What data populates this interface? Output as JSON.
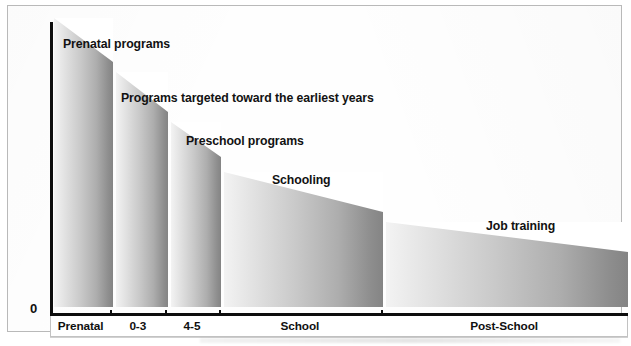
{
  "chart_data": {
    "type": "bar",
    "title": "",
    "subtitle": "",
    "xlabel": "",
    "ylabel": "Rate of Return to Investment in Human Capital",
    "y_zero_tick": "0",
    "grid": false,
    "legend_position": "none",
    "y_axis_note": "unlabeled ordinal scale, only the origin 0 is marked",
    "categories": [
      "Prenatal",
      "0-3",
      "4-5",
      "School",
      "Post-School"
    ],
    "series": [
      {
        "name": "Rate of return to investment in human capital",
        "values": [
          0.98,
          0.8,
          0.63,
          0.46,
          0.29
        ],
        "value_note": "normalized heights read off the bar tops; curve declines monotonically"
      }
    ],
    "bar_top_left_fraction": [
      1.0,
      0.8,
      0.63,
      0.46,
      0.29
    ],
    "bar_top_right_fraction": [
      0.84,
      0.67,
      0.52,
      0.33,
      0.19
    ],
    "annotations": [
      {
        "text": "Prenatal programs",
        "left": 55,
        "top": 31
      },
      {
        "text": "Programs targeted toward the earliest years",
        "left": 113,
        "top": 85
      },
      {
        "text": "Preschool programs",
        "left": 178,
        "top": 128
      },
      {
        "text": "Schooling",
        "left": 264,
        "top": 167
      },
      {
        "text": "Job training",
        "left": 478,
        "top": 213
      }
    ],
    "bars": [
      {
        "label": "Prenatal",
        "left": 46,
        "width": 59,
        "top_left": 18,
        "top_right": 62
      },
      {
        "label": "0-3",
        "left": 108,
        "width": 52,
        "top_left": 72,
        "top_right": 112
      },
      {
        "label": "4-5",
        "left": 163,
        "width": 50,
        "top_left": 122,
        "top_right": 157
      },
      {
        "label": "School",
        "left": 216,
        "width": 159,
        "top_left": 172,
        "top_right": 212
      },
      {
        "label": "Post-School",
        "left": 378,
        "width": 242,
        "top_left": 222,
        "top_right": 252
      }
    ],
    "category_cells": [
      {
        "label": "Prenatal",
        "flex": 59
      },
      {
        "label": "0-3",
        "flex": 55
      },
      {
        "label": "4-5",
        "flex": 53
      },
      {
        "label": "School",
        "flex": 162
      },
      {
        "label": "Post-School",
        "flex": 245
      }
    ],
    "colors": {
      "bar_light": "#f3f3f3",
      "bar_dark": "#848484",
      "axis": "#0d0d0d",
      "text": "#101010",
      "frame": "#b9b9b9",
      "background": "#ffffff"
    }
  }
}
